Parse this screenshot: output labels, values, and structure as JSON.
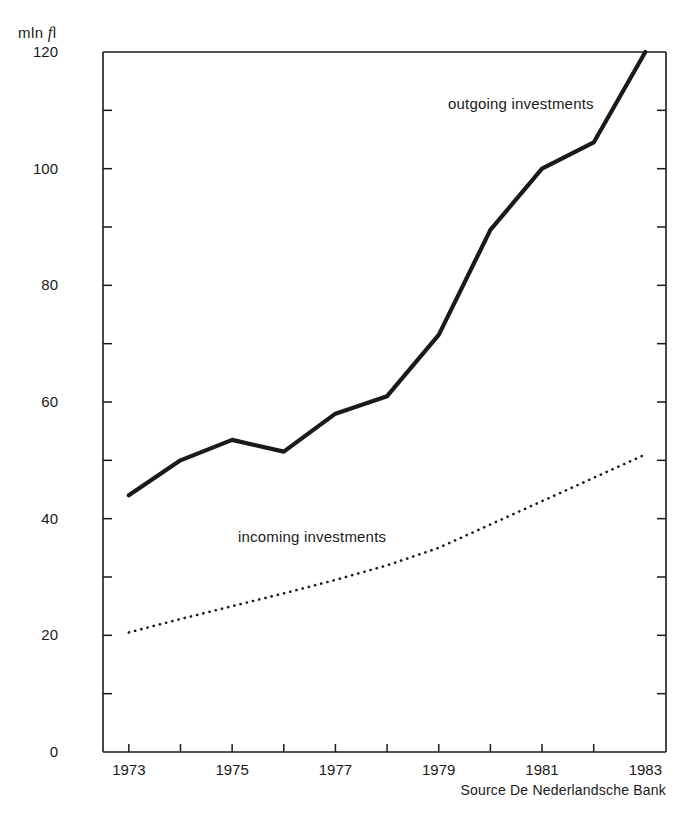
{
  "chart_data": {
    "type": "line",
    "title": "",
    "subtitle": "",
    "xlabel": "",
    "ylabel": "mln fl",
    "ylabel_parts": {
      "prefix": "mln",
      "italic": "f",
      "suffix": "l"
    },
    "xlim": [
      1972.5,
      1983.4
    ],
    "ylim": [
      0,
      120
    ],
    "grid": false,
    "legend_position": "inline-annotations",
    "x": [
      1973,
      1974,
      1975,
      1976,
      1977,
      1978,
      1979,
      1980,
      1981,
      1982,
      1983
    ],
    "ytick_labels": [
      "0",
      "20",
      "40",
      "60",
      "80",
      "100",
      "120"
    ],
    "ytick_values": [
      0,
      20,
      40,
      60,
      80,
      100,
      120
    ],
    "yminor_values": [
      10,
      30,
      50,
      70,
      90,
      110
    ],
    "xtick_labels": [
      "1973",
      "1975",
      "1977",
      "1979",
      "1981",
      "1983"
    ],
    "xtick_values": [
      1973,
      1975,
      1977,
      1979,
      1981,
      1983
    ],
    "xminor_values": [
      1974,
      1976,
      1978,
      1980,
      1982
    ],
    "series": [
      {
        "name": "outgoing investments",
        "style": "solid-thick",
        "color": "#1a1a1a",
        "values": [
          44,
          50,
          53.5,
          51.5,
          58,
          61,
          71.5,
          89.5,
          100,
          104.5,
          120
        ]
      },
      {
        "name": "incoming investments",
        "style": "dotted",
        "color": "#1a1a1a",
        "values": [
          20.5,
          22.8,
          25,
          27.2,
          29.5,
          32,
          35,
          39,
          43,
          47,
          51
        ]
      }
    ],
    "annotations": [
      {
        "text": "outgoing investments",
        "series": "outgoing investments"
      },
      {
        "text": "incoming investments",
        "series": "incoming investments"
      }
    ],
    "source": "Source  De Nederlandsche Bank"
  }
}
